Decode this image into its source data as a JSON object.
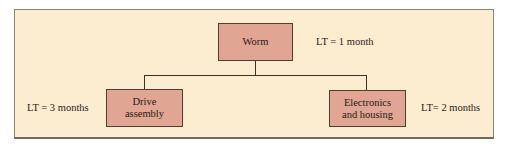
{
  "diagram": {
    "type": "product-structure-tree",
    "root": {
      "label": "Worm",
      "lead_time": "LT = 1 month"
    },
    "children": [
      {
        "label": "Drive assembly",
        "label_lines": [
          "Drive",
          "assembly"
        ],
        "lead_time": "LT = 3 months"
      },
      {
        "label": "Electronics and housing",
        "label_lines": [
          "Electronics",
          "and housing"
        ],
        "lead_time": "LT= 2 months"
      }
    ],
    "colors": {
      "background": "#fcedd1",
      "node_fill": "#e0a593",
      "node_border": "#5a3a30",
      "connector": "#3e3228"
    }
  }
}
